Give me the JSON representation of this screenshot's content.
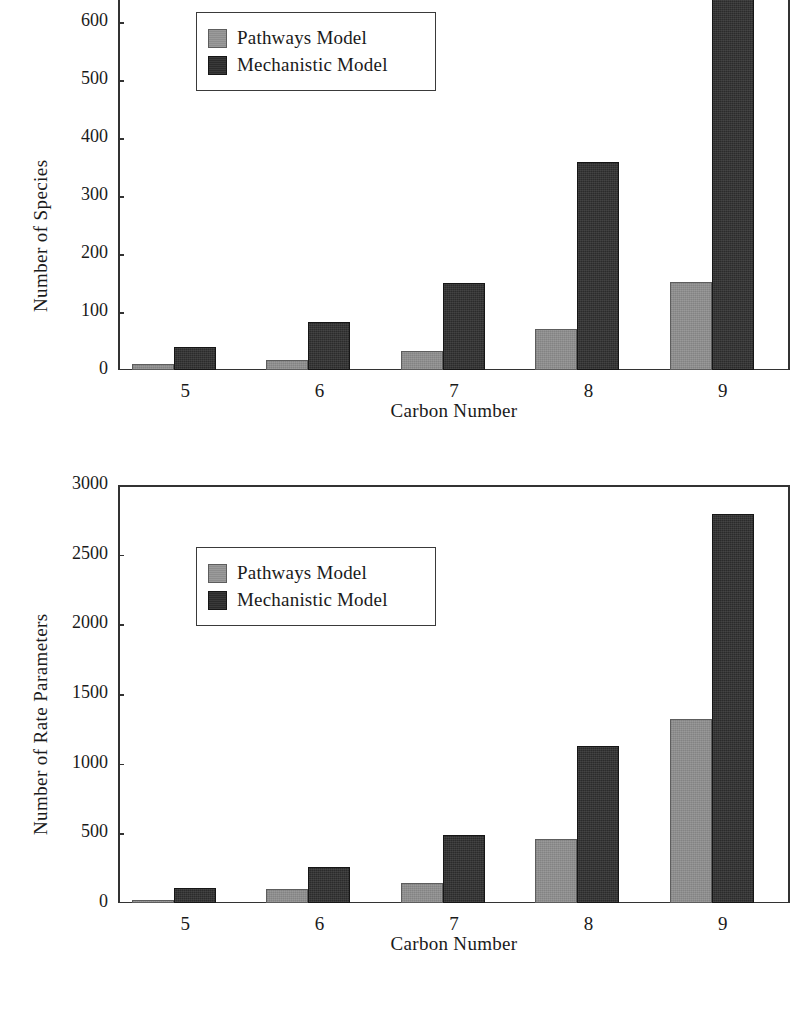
{
  "figure": {
    "series_names": [
      "Pathways Model",
      "Mechanistic Model"
    ],
    "colors": {
      "pathways": "#8d8d8d",
      "mechanistic": "#2b2b2b",
      "axis": "#333333",
      "background": "#ffffff"
    }
  },
  "chart_data": [
    {
      "type": "bar",
      "title": "",
      "xlabel": "Carbon Number",
      "ylabel": "Number of  Species",
      "categories": [
        "5",
        "6",
        "7",
        "8",
        "9"
      ],
      "xticklabels": [
        "5",
        "6",
        "7",
        "8",
        "9"
      ],
      "yticklabels": [
        "0",
        "100",
        "200",
        "300",
        "400",
        "500",
        "600"
      ],
      "ytickvalues": [
        0,
        100,
        200,
        300,
        400,
        500,
        600
      ],
      "ylim": [
        0,
        600
      ],
      "ylim_note": "top of plot area is clipped; tallest bar extends past 600",
      "grid": false,
      "legend_position": "upper left",
      "series": [
        {
          "name": "Pathways Model",
          "values": [
            10,
            18,
            33,
            70,
            152
          ]
        },
        {
          "name": "Mechanistic Model",
          "values": [
            40,
            82,
            150,
            359,
            700
          ]
        }
      ]
    },
    {
      "type": "bar",
      "title": "",
      "xlabel": "Carbon Number",
      "ylabel": "Number of Rate Parameters",
      "categories": [
        "5",
        "6",
        "7",
        "8",
        "9"
      ],
      "xticklabels": [
        "5",
        "6",
        "7",
        "8",
        "9"
      ],
      "yticklabels": [
        "0",
        "500",
        "1000",
        "1500",
        "2000",
        "2500",
        "3000"
      ],
      "ytickvalues": [
        0,
        500,
        1000,
        1500,
        2000,
        2500,
        3000
      ],
      "ylim": [
        0,
        3000
      ],
      "grid": false,
      "legend_position": "upper left",
      "series": [
        {
          "name": "Pathways Model",
          "values": [
            20,
            100,
            145,
            460,
            1320
          ]
        },
        {
          "name": "Mechanistic Model",
          "values": [
            105,
            262,
            487,
            1125,
            2790
          ]
        }
      ]
    }
  ]
}
